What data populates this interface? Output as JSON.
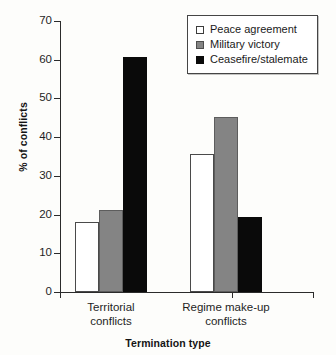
{
  "chart_data": {
    "type": "bar",
    "title": "",
    "xlabel": "Termination type",
    "ylabel": "% of conflicts",
    "ylim": [
      0,
      70
    ],
    "yticks": [
      0,
      10,
      20,
      30,
      40,
      50,
      60,
      70
    ],
    "grid": false,
    "legend_position": "top-right",
    "categories": [
      "Territorial conflicts",
      "Regime make-up conflicts"
    ],
    "category_lines": [
      [
        "Territorial",
        "conflicts"
      ],
      [
        "Regime make-up",
        "conflicts"
      ]
    ],
    "series": [
      {
        "name": "Peace agreement",
        "color": "#ffffff",
        "values": [
          18.0,
          35.6
        ]
      },
      {
        "name": "Military victory",
        "color": "#848484",
        "values": [
          21.3,
          45.3
        ]
      },
      {
        "name": "Ceasefire/stalemate",
        "color": "#0a0a0a",
        "values": [
          60.7,
          19.3
        ]
      }
    ]
  },
  "axis": {
    "y_title": "% of conflicts",
    "x_title": "Termination type",
    "tick_labels": [
      "0",
      "10",
      "20",
      "30",
      "40",
      "50",
      "60",
      "70"
    ]
  },
  "legend": {
    "items": [
      {
        "label": "Peace agreement",
        "swatch": "legend-swatch-peace-agreement"
      },
      {
        "label": "Military victory",
        "swatch": "legend-swatch-military-victory"
      },
      {
        "label": "Ceasefire/stalemate",
        "swatch": "legend-swatch-ceasefire-stalemate"
      }
    ]
  }
}
